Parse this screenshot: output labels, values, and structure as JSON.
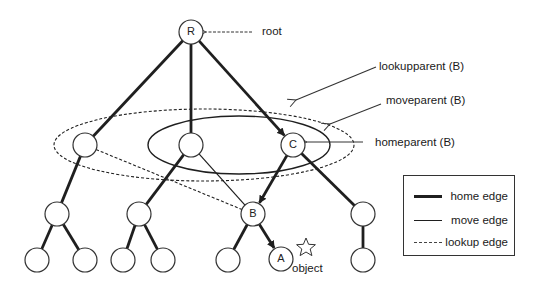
{
  "diagram": {
    "type": "tree-with-parent-pointers",
    "nodes": [
      {
        "id": "R",
        "label": "R",
        "x": 191,
        "y": 32
      },
      {
        "id": "n1",
        "label": "",
        "x": 85,
        "y": 145
      },
      {
        "id": "n2",
        "label": "",
        "x": 191,
        "y": 145
      },
      {
        "id": "C",
        "label": "C",
        "x": 293,
        "y": 145
      },
      {
        "id": "n3",
        "label": "",
        "x": 57,
        "y": 214
      },
      {
        "id": "n4",
        "label": "",
        "x": 139,
        "y": 214
      },
      {
        "id": "B",
        "label": "B",
        "x": 253,
        "y": 214
      },
      {
        "id": "n5",
        "label": "",
        "x": 363,
        "y": 214
      },
      {
        "id": "l1",
        "label": "",
        "x": 37,
        "y": 260
      },
      {
        "id": "l2",
        "label": "",
        "x": 85,
        "y": 260
      },
      {
        "id": "l3",
        "label": "",
        "x": 123,
        "y": 260
      },
      {
        "id": "l4",
        "label": "",
        "x": 163,
        "y": 260
      },
      {
        "id": "l5",
        "label": "",
        "x": 228,
        "y": 260
      },
      {
        "id": "A",
        "label": "A",
        "x": 281,
        "y": 259
      },
      {
        "id": "l6",
        "label": "",
        "x": 363,
        "y": 260
      }
    ],
    "edges": [
      {
        "from": "R",
        "to": "n1",
        "kind": "home"
      },
      {
        "from": "R",
        "to": "n2",
        "kind": "home"
      },
      {
        "from": "R",
        "to": "C",
        "kind": "home",
        "arrow": true
      },
      {
        "from": "n1",
        "to": "n3",
        "kind": "home"
      },
      {
        "from": "n2",
        "to": "n4",
        "kind": "home"
      },
      {
        "from": "C",
        "to": "B",
        "kind": "home",
        "arrow": true
      },
      {
        "from": "C",
        "to": "n5",
        "kind": "home"
      },
      {
        "from": "n3",
        "to": "l1",
        "kind": "home"
      },
      {
        "from": "n3",
        "to": "l2",
        "kind": "home"
      },
      {
        "from": "n4",
        "to": "l3",
        "kind": "home"
      },
      {
        "from": "n4",
        "to": "l4",
        "kind": "home"
      },
      {
        "from": "B",
        "to": "l5",
        "kind": "home"
      },
      {
        "from": "B",
        "to": "A",
        "kind": "home",
        "arrow": true
      },
      {
        "from": "n5",
        "to": "l6",
        "kind": "home"
      },
      {
        "from": "n2",
        "to": "B",
        "kind": "move"
      },
      {
        "from": "n1",
        "to": "B",
        "kind": "lookup"
      }
    ],
    "regions": [
      {
        "name": "lookupparent-region",
        "style": "dashed",
        "cx": 204,
        "cy": 145,
        "rx": 150,
        "ry": 36
      },
      {
        "name": "moveparent-region",
        "style": "solid",
        "cx": 239,
        "cy": 145,
        "rx": 91,
        "ry": 29
      }
    ],
    "annotations": {
      "root": "root",
      "lookupparent": "lookupparent (B)",
      "moveparent": "moveparent (B)",
      "homeparent": "homeparent (B)",
      "object": "object"
    },
    "object_marker": "star-icon"
  },
  "legend": {
    "items": [
      {
        "label": "home edge",
        "style": "thick-solid"
      },
      {
        "label": "move edge",
        "style": "thin-solid"
      },
      {
        "label": "lookup edge",
        "style": "dashed"
      }
    ]
  },
  "colors": {
    "stroke": "#1f1f1f",
    "background": "#ffffff"
  }
}
